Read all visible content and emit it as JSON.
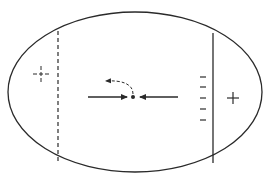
{
  "diagram": {
    "colors": {
      "stroke": "#2a2a2a",
      "background": "#ffffff"
    },
    "outline": {
      "shape": "ellipse",
      "cx": 135,
      "cy": 92,
      "rx": 127,
      "ry": 80
    },
    "left_boundary": {
      "style": "dashed",
      "x": 58,
      "y1": 31,
      "y2": 162
    },
    "right_boundary": {
      "style": "solid",
      "x": 213,
      "y1": 33,
      "y2": 163
    },
    "charges": {
      "left_plus": {
        "symbol": "+",
        "style": "dashed",
        "x": 41,
        "y": 74
      },
      "right_plus": {
        "symbol": "+",
        "style": "solid",
        "x": 233,
        "y": 98
      },
      "minus_marks": [
        {
          "symbol": "−",
          "x": 203,
          "y": 77
        },
        {
          "symbol": "−",
          "x": 203,
          "y": 87
        },
        {
          "symbol": "−",
          "x": 203,
          "y": 98
        },
        {
          "symbol": "−",
          "x": 203,
          "y": 109
        },
        {
          "symbol": "−",
          "x": 203,
          "y": 120
        }
      ]
    },
    "particle": {
      "x": 133,
      "y": 97
    },
    "arrows": [
      {
        "id": "left-force",
        "direction": "right",
        "x1": 88,
        "y1": 97,
        "x2": 127,
        "y2": 97,
        "style": "solid"
      },
      {
        "id": "right-force",
        "direction": "left",
        "x1": 178,
        "y1": 97,
        "x2": 139,
        "y2": 97,
        "style": "solid"
      },
      {
        "id": "deflection",
        "direction": "up-left",
        "style": "dashed",
        "path": "M133 94 C 133 84, 122 80, 106 81"
      }
    ]
  }
}
